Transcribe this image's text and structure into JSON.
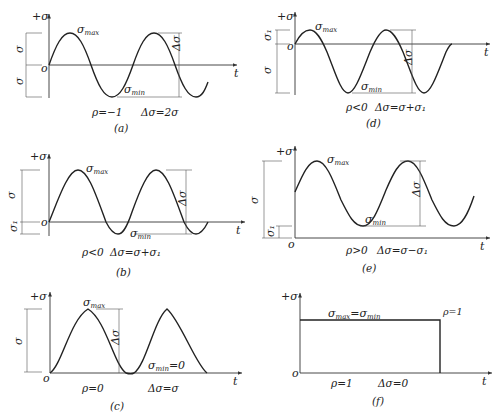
{
  "figure": {
    "panels": [
      {
        "id": "a",
        "caption": "(a)",
        "y_axis_label": "+σ",
        "origin_label": "o",
        "x_axis_label": "t",
        "max_label": "σ",
        "max_sub": "max",
        "min_label": "σ",
        "min_sub": "min",
        "range_label": "Δσ",
        "left_dims": [
          "σ",
          "σ"
        ],
        "ratio": "ρ=−1",
        "delta": "Δσ=2σ"
      },
      {
        "id": "d",
        "caption": "(d)",
        "y_axis_label": "+σ",
        "origin_label": "o",
        "x_axis_label": "t",
        "max_label": "σ",
        "max_sub": "max",
        "min_label": "σ",
        "min_sub": "min",
        "range_label": "Δσ",
        "left_dims": [
          "σ₁",
          "σ"
        ],
        "ratio": "ρ<0",
        "delta": "Δσ=σ+σ₁"
      },
      {
        "id": "b",
        "caption": "(b)",
        "y_axis_label": "+σ",
        "origin_label": "o",
        "x_axis_label": "t",
        "max_label": "σ",
        "max_sub": "max",
        "min_label": "σ",
        "min_sub": "min",
        "range_label": "Δσ",
        "left_dims": [
          "σ",
          "σ₁"
        ],
        "ratio": "ρ<0",
        "delta": "Δσ=σ+σ₁"
      },
      {
        "id": "e",
        "caption": "(e)",
        "y_axis_label": "+σ",
        "origin_label": "o",
        "x_axis_label": "t",
        "max_label": "σ",
        "max_sub": "max",
        "min_label": "σ",
        "min_sub": "min",
        "range_label": "Δσ",
        "left_dims": [
          "σ",
          "σ₁"
        ],
        "ratio": "ρ>0",
        "delta": "Δσ=σ−σ₁"
      },
      {
        "id": "c",
        "caption": "(c)",
        "y_axis_label": "+σ",
        "origin_label": "o",
        "x_axis_label": "t",
        "max_label": "σ",
        "max_sub": "max",
        "min_text": "σ",
        "min_sub": "min",
        "min_eq": "=0",
        "range_label": "Δσ",
        "left_dims": [
          "σ"
        ],
        "ratio": "ρ=0",
        "delta": "Δσ=σ"
      },
      {
        "id": "f",
        "caption": "(f)",
        "y_axis_label": "+σ",
        "origin_label": "o",
        "x_axis_label": "t",
        "eq_max": "σ",
        "eq_max_sub": "max",
        "eq_mid": "=σ",
        "eq_min_sub": "min",
        "rho_note": "ρ=1",
        "ratio": "ρ=1",
        "delta": "Δσ=0"
      }
    ]
  }
}
